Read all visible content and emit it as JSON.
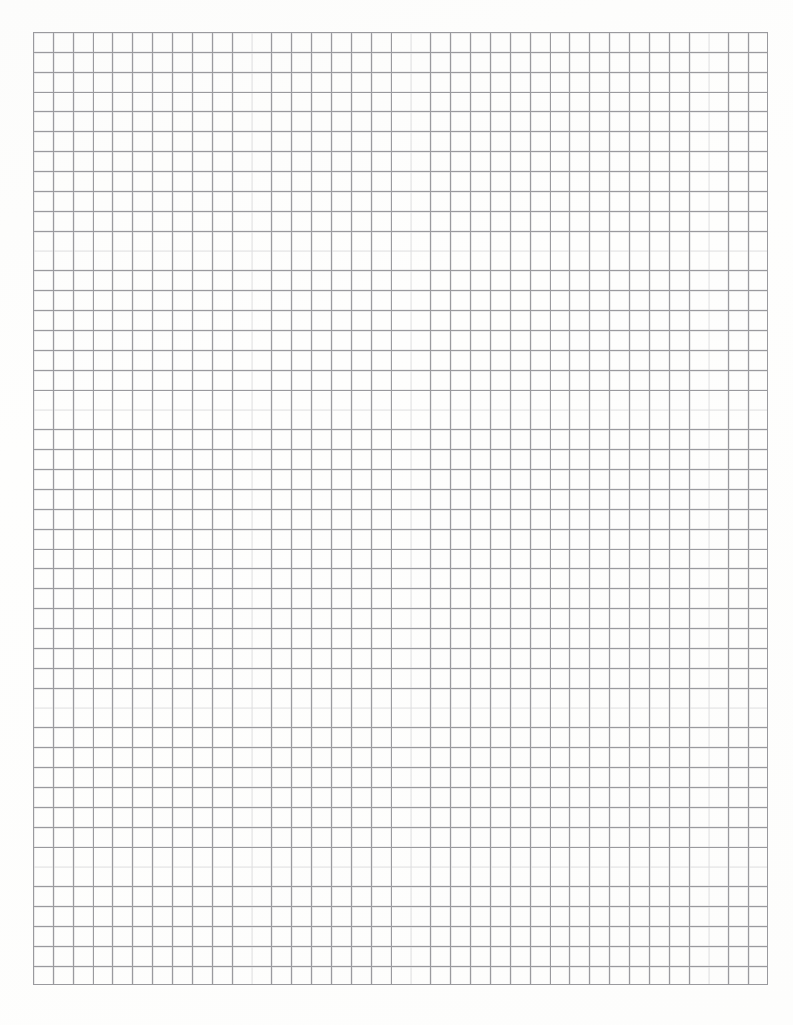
{
  "document": {
    "kind": "graph-paper",
    "title": "Graph Paper",
    "page_width_px": 793,
    "page_height_px": 1025,
    "background_color": "#fdfdfc",
    "has_text": false,
    "has_labels": false
  },
  "grid": {
    "name": "square-ruled-grid",
    "left_px": 33,
    "top_px": 32,
    "width_px": 735,
    "height_px": 953,
    "cell_size_px": 19.87,
    "columns": 37,
    "rows": 48,
    "line_color": "#9a9a9e",
    "line_soft_color": "#c3c3c7",
    "line_width_px": 0.9,
    "major_lines": false,
    "margins": {
      "left_px": 33,
      "top_px": 32,
      "right_px": 25,
      "bottom_px": 40
    }
  }
}
